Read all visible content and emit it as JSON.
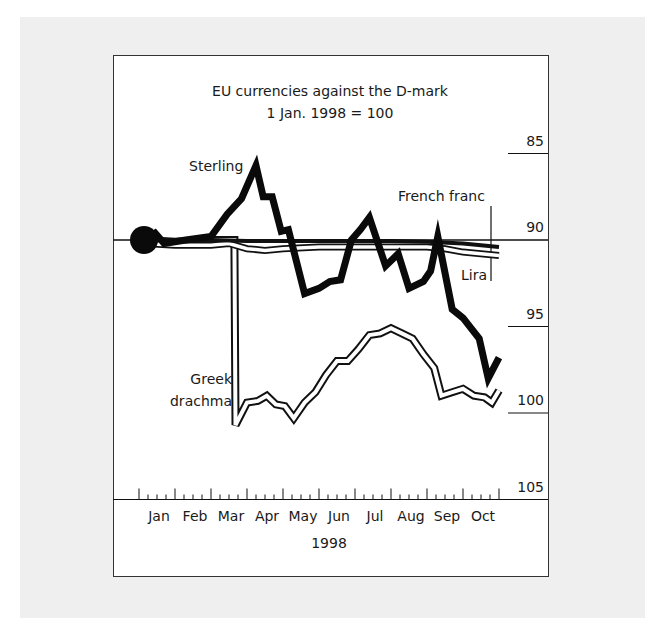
{
  "chart_data": {
    "type": "line",
    "title": "EU currencies against the D-mark",
    "subtitle": "1 Jan. 1998 = 100",
    "xlabel": "1998",
    "ylabel": "",
    "x_ticks": [
      "Jan",
      "Feb",
      "Mar",
      "Apr",
      "May",
      "Jun",
      "Jul",
      "Aug",
      "Sep",
      "Oct"
    ],
    "y_ticks": [
      85,
      90,
      95,
      100,
      105
    ],
    "ylim": [
      85,
      106
    ],
    "grid": false,
    "legend": "inline labels",
    "x_unit": "months since 1 Jan 1998",
    "series": [
      {
        "name": "Sterling",
        "style": "thick black",
        "x": [
          0.17,
          0.45,
          0.7,
          1.3,
          2.0,
          2.45,
          2.85,
          3.25,
          3.45,
          3.7,
          3.95,
          4.15,
          4.6,
          5.0,
          5.3,
          5.6,
          5.9,
          6.15,
          6.4,
          6.85,
          7.2,
          7.5,
          7.9,
          8.1,
          8.3,
          8.7,
          9.0,
          9.45,
          9.7,
          10.0
        ],
        "values": [
          100.0,
          100.4,
          99.8,
          100.0,
          100.2,
          101.5,
          102.4,
          104.3,
          102.5,
          102.5,
          100.5,
          100.6,
          96.9,
          97.2,
          97.6,
          97.7,
          100.0,
          100.6,
          101.3,
          98.5,
          99.2,
          97.2,
          97.6,
          98.2,
          100.2,
          96.0,
          95.5,
          94.3,
          92.0,
          93.2
        ]
      },
      {
        "name": "French franc",
        "style": "black-filled band",
        "x": [
          0.17,
          1.0,
          2.0,
          3.0,
          4.0,
          5.0,
          6.0,
          7.0,
          8.0,
          9.0,
          10.0
        ],
        "values": [
          100.0,
          100.0,
          100.0,
          99.95,
          99.95,
          99.95,
          99.95,
          99.95,
          99.9,
          99.8,
          99.6
        ]
      },
      {
        "name": "Lira",
        "style": "white band with black outline",
        "x": [
          0.17,
          1.0,
          2.0,
          2.5,
          3.0,
          3.5,
          4.0,
          5.0,
          6.0,
          7.0,
          8.0,
          8.5,
          9.0,
          10.0
        ],
        "values": [
          99.8,
          99.7,
          99.7,
          99.8,
          99.5,
          99.4,
          99.5,
          99.6,
          99.6,
          99.6,
          99.6,
          99.5,
          99.3,
          99.1
        ]
      },
      {
        "name": "Greek drachma",
        "style": "white band with black outline",
        "x": [
          0.17,
          1.0,
          2.0,
          2.65,
          2.68,
          3.0,
          3.3,
          3.55,
          3.8,
          4.05,
          4.3,
          4.6,
          4.9,
          5.2,
          5.5,
          5.8,
          6.1,
          6.4,
          6.7,
          7.0,
          7.3,
          7.6,
          7.9,
          8.2,
          8.4,
          8.7,
          9.0,
          9.3,
          9.6,
          9.8,
          10.0
        ],
        "values": [
          100.0,
          99.9,
          100.0,
          100.0,
          89.3,
          90.6,
          90.7,
          91.0,
          90.5,
          90.4,
          89.7,
          90.6,
          91.2,
          92.2,
          93.0,
          93.0,
          93.7,
          94.5,
          94.6,
          94.9,
          94.6,
          94.3,
          93.4,
          92.6,
          91.0,
          91.2,
          91.4,
          91.0,
          90.9,
          90.6,
          91.3
        ]
      }
    ],
    "labels": {
      "sterling": "Sterling",
      "french_franc": "French franc",
      "lira": "Lira",
      "greek_line1": "Greek",
      "greek_line2": "drachma"
    },
    "y_tick_labels": [
      "105",
      "100",
      "95",
      "90",
      "85"
    ]
  }
}
